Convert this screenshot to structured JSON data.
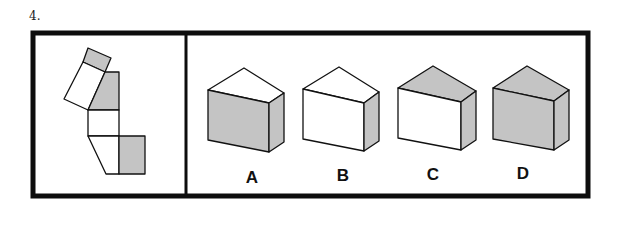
{
  "question": {
    "number": "4."
  },
  "colors": {
    "shade": "#c4c4c4",
    "line": "#111111",
    "frame": "#0d0d0d"
  },
  "options": [
    {
      "label": "A",
      "front": "shaded",
      "top": "white",
      "side": "shaded"
    },
    {
      "label": "B",
      "front": "white",
      "top": "white",
      "side": "shaded"
    },
    {
      "label": "C",
      "front": "white",
      "top": "shaded",
      "side": "shaded"
    },
    {
      "label": "D",
      "front": "shaded",
      "top": "shaded",
      "side": "shaded"
    }
  ]
}
